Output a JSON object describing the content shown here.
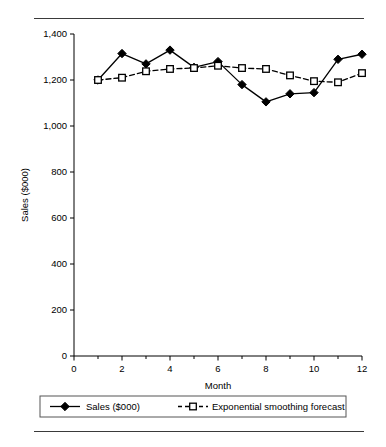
{
  "figure": {
    "top_rule": "horizontal-rule",
    "bottom_rule": "horizontal-rule"
  },
  "chart_data": {
    "type": "line",
    "title": "",
    "xlabel": "Month",
    "ylabel": "Sales ($000)",
    "x": [
      1,
      2,
      3,
      4,
      5,
      6,
      7,
      8,
      9,
      10,
      11,
      12
    ],
    "xlim": [
      0,
      12
    ],
    "ylim": [
      0,
      1400
    ],
    "xticks": [
      0,
      2,
      4,
      6,
      8,
      10,
      12
    ],
    "xtick_labels": [
      "0",
      "2",
      "4",
      "6",
      "8",
      "10",
      "12"
    ],
    "x_minor_ticks": [
      1,
      3,
      5,
      7,
      9,
      11
    ],
    "yticks": [
      0,
      200,
      400,
      600,
      800,
      1000,
      1200,
      1400
    ],
    "ytick_labels": [
      "0",
      "200",
      "400",
      "600",
      "800",
      "1,000",
      "1,200",
      "1,400"
    ],
    "grid": false,
    "legend_position": "bottom",
    "series": [
      {
        "name": "Sales ($000)",
        "marker": "filled-diamond",
        "linestyle": "solid",
        "color": "#000000",
        "values": [
          1200,
          1315,
          1270,
          1330,
          1255,
          1280,
          1180,
          1105,
          1140,
          1145,
          1290,
          1312
        ]
      },
      {
        "name": "Exponential smoothing forecast",
        "marker": "open-square",
        "linestyle": "dashed",
        "color": "#000000",
        "values": [
          1200,
          1210,
          1238,
          1248,
          1252,
          1262,
          1252,
          1248,
          1220,
          1195,
          1190,
          1230
        ]
      }
    ]
  },
  "legend": {
    "items": [
      {
        "label": "Sales ($000)",
        "marker": "filled-diamond",
        "linestyle": "solid"
      },
      {
        "label": "Exponential smoothing forecast",
        "marker": "open-square",
        "linestyle": "dashed"
      }
    ]
  }
}
